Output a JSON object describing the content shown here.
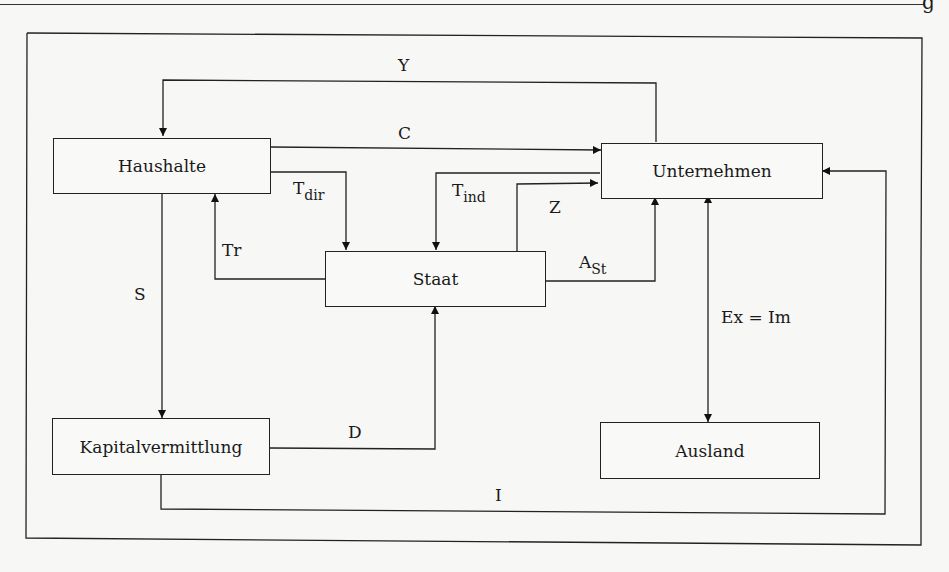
{
  "page": {
    "corner_glyph": "g"
  },
  "diagram": {
    "nodes": {
      "haushalte": "Haushalte",
      "unternehmen": "Unternehmen",
      "staat": "Staat",
      "kapitalvermittlung": "Kapitalvermittlung",
      "ausland": "Ausland"
    },
    "flows": {
      "Y": {
        "main": "Y",
        "from": "Unternehmen",
        "to": "Haushalte"
      },
      "C": {
        "main": "C",
        "from": "Haushalte",
        "to": "Unternehmen"
      },
      "T_dir": {
        "main": "T",
        "sub": "dir",
        "from": "Haushalte",
        "to": "Staat"
      },
      "T_ind": {
        "main": "T",
        "sub": "ind",
        "from": "Unternehmen",
        "to": "Staat"
      },
      "Z": {
        "main": "Z",
        "from": "Staat",
        "to": "Unternehmen"
      },
      "Tr": {
        "main": "Tr",
        "from": "Staat",
        "to": "Haushalte"
      },
      "A_St": {
        "main": "A",
        "sub": "St",
        "from": "Staat",
        "to": "Unternehmen"
      },
      "S": {
        "main": "S",
        "from": "Haushalte",
        "to": "Kapitalvermittlung"
      },
      "D": {
        "main": "D",
        "from": "Kapitalvermittlung",
        "to": "Staat"
      },
      "I": {
        "main": "I",
        "from": "Kapitalvermittlung",
        "to": "Unternehmen"
      },
      "ExIm": {
        "main": "Ex = Im",
        "from": "Unternehmen",
        "to": "Ausland",
        "bidirectional": true
      }
    }
  }
}
